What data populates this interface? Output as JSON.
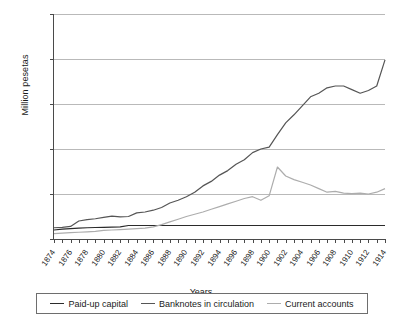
{
  "chart_data": {
    "type": "line",
    "title": "",
    "xlabel": "Years",
    "ylabel": "Million pesetas",
    "ylim": [
      0,
      2500
    ],
    "yticks": [
      0,
      500,
      1000,
      1500,
      2000,
      2500
    ],
    "ytick_labels": [
      "0",
      "500",
      "1000",
      "1500",
      "2000",
      "2500"
    ],
    "xlim": [
      1874,
      1914
    ],
    "grid": true,
    "legend_position": "bottom",
    "x": [
      1874,
      1875,
      1876,
      1877,
      1878,
      1879,
      1880,
      1881,
      1882,
      1883,
      1884,
      1885,
      1886,
      1887,
      1888,
      1889,
      1890,
      1891,
      1892,
      1893,
      1894,
      1895,
      1896,
      1897,
      1898,
      1899,
      1900,
      1901,
      1902,
      1903,
      1904,
      1905,
      1906,
      1907,
      1908,
      1909,
      1910,
      1911,
      1912,
      1913,
      1914
    ],
    "xtick_labels": [
      "1874",
      "1876",
      "1878",
      "1880",
      "1882",
      "1884",
      "1886",
      "1888",
      "1890",
      "1892",
      "1894",
      "1896",
      "1898",
      "1900",
      "1902",
      "1904",
      "1906",
      "1908",
      "1910",
      "1912",
      "1914"
    ],
    "series": [
      {
        "name": "Paid-up capital",
        "color": "#2b2b2b",
        "values": [
          100,
          110,
          115,
          120,
          125,
          128,
          130,
          132,
          135,
          150,
          150,
          150,
          150,
          150,
          150,
          150,
          150,
          150,
          150,
          150,
          150,
          150,
          150,
          150,
          150,
          150,
          150,
          150,
          150,
          150,
          150,
          150,
          150,
          150,
          150,
          150,
          150,
          150,
          150,
          150,
          150
        ]
      },
      {
        "name": "Banknotes in circulation",
        "color": "#555555",
        "values": [
          125,
          130,
          140,
          200,
          215,
          225,
          240,
          255,
          245,
          250,
          290,
          300,
          320,
          350,
          400,
          430,
          470,
          520,
          590,
          640,
          710,
          760,
          830,
          880,
          960,
          1000,
          1020,
          1160,
          1290,
          1380,
          1480,
          1580,
          1620,
          1680,
          1700,
          1700,
          1660,
          1620,
          1650,
          1700,
          1990
        ]
      },
      {
        "name": "Current accounts",
        "color": "#adadad",
        "values": [
          60,
          65,
          70,
          75,
          80,
          85,
          95,
          100,
          105,
          110,
          115,
          120,
          135,
          160,
          190,
          220,
          250,
          275,
          300,
          330,
          360,
          390,
          420,
          450,
          470,
          430,
          480,
          800,
          700,
          660,
          630,
          600,
          560,
          520,
          530,
          510,
          505,
          510,
          500,
          520,
          560
        ]
      }
    ]
  },
  "legend": {
    "items": [
      {
        "label": "Paid-up capital",
        "color": "#2b2b2b"
      },
      {
        "label": "Banknotes in circulation",
        "color": "#555555"
      },
      {
        "label": "Current accounts",
        "color": "#adadad"
      }
    ]
  }
}
